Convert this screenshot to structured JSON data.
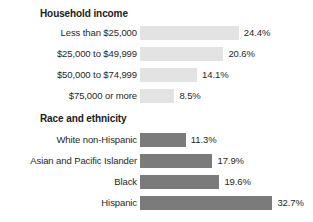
{
  "chart_data": {
    "type": "bar",
    "orientation": "horizontal",
    "title": "",
    "xlabel": "",
    "ylabel": "",
    "grid": false,
    "legend": "none",
    "xlim": [
      0,
      35
    ],
    "value_suffix": "%",
    "groups": [
      {
        "name": "household-income",
        "title": "Household income",
        "bar_style": "light",
        "bar_color": "#e3e3e3",
        "categories": [
          "Less than $25,000",
          "$25,000 to $49,999",
          "$50,000 to $74,999",
          "$75,000 or more"
        ],
        "values": [
          24.4,
          20.6,
          14.1,
          8.5
        ],
        "value_labels": [
          "24.4%",
          "20.6%",
          "14.1%",
          "8.5%"
        ]
      },
      {
        "name": "race-and-ethnicity",
        "title": "Race and ethnicity",
        "bar_style": "dark",
        "bar_color": "#7b7b7b",
        "categories": [
          "White non-Hispanic",
          "Asian and Pacific Islander",
          "Black",
          "Hispanic"
        ],
        "values": [
          11.3,
          17.9,
          19.6,
          32.7
        ],
        "value_labels": [
          "11.3%",
          "17.9%",
          "19.6%",
          "32.7%"
        ]
      }
    ]
  },
  "layout": {
    "bar_origin_x": 140,
    "px_per_unit": 4.05,
    "label_gap": 5,
    "group_title_x": 40,
    "group1_title_y": 10,
    "group2_title_y": 115,
    "group1_first_row_y": 24,
    "group2_first_row_y": 131,
    "row_step": 21
  }
}
